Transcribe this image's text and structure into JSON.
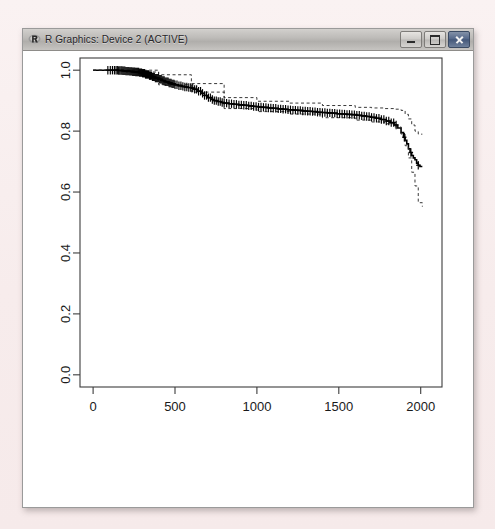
{
  "window": {
    "title": "R Graphics: Device 2 (ACTIVE)",
    "app_icon": "r-logo-icon",
    "buttons": {
      "minimize": "minimize-button",
      "maximize": "maximize-button",
      "close": "close-button"
    },
    "desktop_background": "#f7ecec",
    "titlebar_color": "#bdbbb8",
    "client_background": "#ffffff"
  },
  "chart_data": {
    "type": "line",
    "title": "",
    "subtitle": "",
    "xlabel": "",
    "ylabel": "",
    "xlim": [
      -80,
      2130
    ],
    "ylim": [
      -0.04,
      1.04
    ],
    "xticks": [
      0,
      500,
      1000,
      1500,
      2000
    ],
    "xticklabels": [
      "0",
      "500",
      "1000",
      "1500",
      "2000"
    ],
    "yticks": [
      0.0,
      0.2,
      0.4,
      0.6,
      0.8,
      1.0
    ],
    "yticklabels": [
      "0.0",
      "0.2",
      "0.4",
      "0.6",
      "0.8",
      "1.0"
    ],
    "grid": false,
    "legend": null,
    "annotations": [],
    "axis_color": "#3c3c3c",
    "line_color": "#000000",
    "ci_color": "#222222",
    "series": [
      {
        "name": "Kaplan-Meier survival estimate",
        "style": "step",
        "linetype": "solid",
        "x": [
          0,
          60,
          120,
          150,
          180,
          200,
          220,
          240,
          260,
          280,
          300,
          320,
          340,
          360,
          380,
          400,
          420,
          440,
          460,
          480,
          500,
          520,
          540,
          560,
          580,
          600,
          620,
          640,
          660,
          680,
          700,
          720,
          740,
          760,
          780,
          800,
          830,
          860,
          890,
          920,
          950,
          980,
          1010,
          1040,
          1070,
          1100,
          1130,
          1160,
          1190,
          1220,
          1250,
          1280,
          1310,
          1340,
          1370,
          1400,
          1430,
          1460,
          1490,
          1520,
          1550,
          1580,
          1610,
          1640,
          1670,
          1700,
          1730,
          1760,
          1790,
          1815,
          1840,
          1860,
          1880,
          1895,
          1905,
          1915,
          1925,
          1935,
          1945,
          1955,
          1965,
          1975,
          1985,
          1995,
          2010
        ],
        "y": [
          1.0,
          1.0,
          1.0,
          0.999,
          0.998,
          0.997,
          0.996,
          0.995,
          0.994,
          0.992,
          0.99,
          0.986,
          0.982,
          0.978,
          0.974,
          0.97,
          0.966,
          0.962,
          0.958,
          0.955,
          0.952,
          0.949,
          0.947,
          0.945,
          0.943,
          0.941,
          0.937,
          0.931,
          0.924,
          0.917,
          0.91,
          0.904,
          0.9,
          0.897,
          0.894,
          0.892,
          0.89,
          0.888,
          0.886,
          0.885,
          0.883,
          0.881,
          0.879,
          0.878,
          0.876,
          0.875,
          0.873,
          0.872,
          0.87,
          0.869,
          0.868,
          0.866,
          0.865,
          0.864,
          0.862,
          0.861,
          0.86,
          0.859,
          0.857,
          0.856,
          0.855,
          0.854,
          0.852,
          0.85,
          0.848,
          0.845,
          0.842,
          0.838,
          0.833,
          0.828,
          0.82,
          0.81,
          0.795,
          0.78,
          0.77,
          0.758,
          0.742,
          0.73,
          0.72,
          0.712,
          0.706,
          0.695,
          0.688,
          0.684,
          0.684
        ]
      },
      {
        "name": "Upper 95% confidence limit",
        "style": "step",
        "linetype": "dashed",
        "x": [
          0,
          200,
          400,
          600,
          800,
          1000,
          1200,
          1400,
          1600,
          1700,
          1780,
          1840,
          1880,
          1905,
          1925,
          1945,
          1965,
          1985,
          2010
        ],
        "y": [
          1.0,
          1.0,
          0.985,
          0.956,
          0.91,
          0.898,
          0.892,
          0.884,
          0.878,
          0.876,
          0.874,
          0.872,
          0.868,
          0.855,
          0.84,
          0.82,
          0.8,
          0.79,
          0.79
        ]
      },
      {
        "name": "Lower 95% confidence limit",
        "style": "step",
        "linetype": "dashed",
        "x": [
          0,
          200,
          400,
          600,
          800,
          1000,
          1200,
          1400,
          1600,
          1700,
          1780,
          1840,
          1880,
          1905,
          1925,
          1945,
          1965,
          1985,
          2010
        ],
        "y": [
          1.0,
          0.994,
          0.952,
          0.928,
          0.874,
          0.864,
          0.856,
          0.844,
          0.836,
          0.83,
          0.824,
          0.814,
          0.79,
          0.752,
          0.712,
          0.665,
          0.62,
          0.565,
          0.552
        ]
      }
    ],
    "censor_marks": {
      "symbol": "+",
      "x": [
        90,
        105,
        118,
        130,
        140,
        148,
        156,
        163,
        170,
        176,
        182,
        188,
        194,
        200,
        206,
        212,
        218,
        224,
        230,
        236,
        242,
        248,
        254,
        260,
        266,
        272,
        278,
        284,
        290,
        296,
        302,
        308,
        314,
        320,
        326,
        332,
        338,
        344,
        350,
        356,
        362,
        368,
        374,
        380,
        386,
        392,
        398,
        404,
        410,
        416,
        422,
        428,
        434,
        440,
        446,
        452,
        458,
        464,
        470,
        476,
        482,
        488,
        494,
        500,
        512,
        524,
        536,
        548,
        560,
        572,
        584,
        596,
        608,
        620,
        632,
        644,
        656,
        668,
        680,
        692,
        704,
        716,
        728,
        740,
        752,
        764,
        776,
        788,
        800,
        815,
        830,
        845,
        860,
        875,
        890,
        905,
        920,
        935,
        950,
        965,
        980,
        995,
        1010,
        1025,
        1040,
        1055,
        1070,
        1085,
        1100,
        1115,
        1130,
        1145,
        1160,
        1175,
        1190,
        1205,
        1220,
        1235,
        1250,
        1265,
        1280,
        1295,
        1310,
        1325,
        1340,
        1355,
        1370,
        1385,
        1400,
        1415,
        1430,
        1445,
        1460,
        1475,
        1490,
        1505,
        1520,
        1535,
        1550,
        1565,
        1580,
        1595,
        1610,
        1625,
        1640,
        1655,
        1670,
        1685,
        1700,
        1715,
        1730,
        1745,
        1760,
        1775,
        1790,
        1805,
        1820,
        1835,
        1850,
        1900,
        1940,
        1985
      ]
    }
  }
}
